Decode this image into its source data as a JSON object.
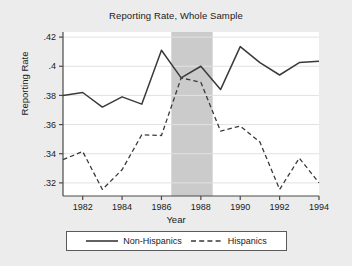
{
  "chart_data": {
    "type": "line",
    "title": "Reporting Rate, Whole Sample",
    "xlabel": "Year",
    "ylabel": "Reporting Rate",
    "x": [
      1981,
      1982,
      1983,
      1984,
      1985,
      1986,
      1987,
      1988,
      1989,
      1990,
      1991,
      1992,
      1993,
      1994
    ],
    "xlim": [
      1981,
      1994
    ],
    "ylim": [
      0.311,
      0.4235
    ],
    "xticks": [
      1982,
      1984,
      1986,
      1988,
      1990,
      1992,
      1994
    ],
    "xtick_labels": [
      "1982",
      "1984",
      "1986",
      "1988",
      "1990",
      "1992",
      "1994"
    ],
    "yticks": [
      0.32,
      0.34,
      0.36,
      0.38,
      0.4,
      0.42
    ],
    "ytick_labels": [
      ".32",
      ".34",
      ".36",
      ".38",
      ".4",
      ".42"
    ],
    "grid": "horizontal",
    "legend_position": "below",
    "series": [
      {
        "name": "Non-Hispanics",
        "style": "solid",
        "color": "#3a3a3a",
        "values": [
          0.38,
          0.382,
          0.372,
          0.379,
          0.374,
          0.411,
          0.392,
          0.4,
          0.384,
          0.4135,
          0.4025,
          0.394,
          0.4025,
          0.4035
        ]
      },
      {
        "name": "Hispanics",
        "style": "dashed",
        "color": "#3a3a3a",
        "values": [
          0.336,
          0.3415,
          0.3155,
          0.329,
          0.353,
          0.3525,
          0.392,
          0.389,
          0.3555,
          0.359,
          0.348,
          0.3155,
          0.337,
          0.32
        ]
      }
    ],
    "shaded_region": {
      "label": "",
      "x_start": 1986.5,
      "x_end": 1988.6,
      "color": "#cbcbcb"
    },
    "background_color": "#ececed",
    "plot_background_color": "#ffffff"
  }
}
